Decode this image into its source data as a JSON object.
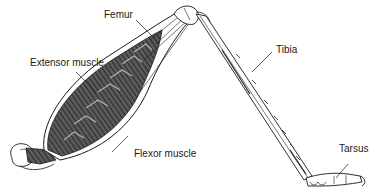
{
  "diagram": {
    "labels": {
      "femur": "Femur",
      "extensor": "Extensor muscle",
      "flexor": "Flexor muscle",
      "tibia": "Tibia",
      "tarsus": "Tarsus"
    },
    "colors": {
      "line": "#1a1a1a",
      "muscle_dark": "#3a3a3a",
      "muscle_light": "#9a9a9a",
      "background": "#ffffff"
    }
  }
}
